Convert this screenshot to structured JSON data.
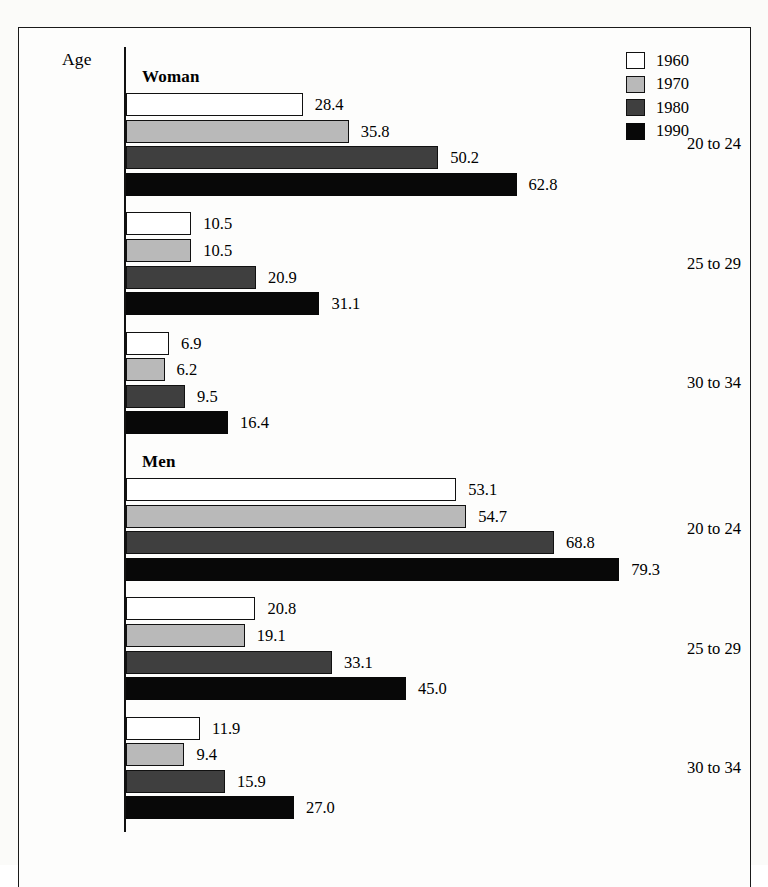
{
  "chart_data": {
    "type": "bar",
    "orientation": "horizontal",
    "title": "",
    "xlabel": "",
    "ylabel": "Age",
    "xlim": [
      0,
      100
    ],
    "grid": false,
    "legend_position": "top-right",
    "legend_entries": [
      "1960",
      "1970",
      "1980",
      "1990"
    ],
    "series_colors": {
      "1960": "#ffffff",
      "1970": "#b9b9b9",
      "1980": "#3f3f3f",
      "1990": "#080808"
    },
    "categories": [
      "20 to 24",
      "25 to 29",
      "30 to 34"
    ],
    "panels": [
      {
        "name": "Woman",
        "series": [
          {
            "name": "1960",
            "values": [
              28.4,
              10.5,
              6.9
            ]
          },
          {
            "name": "1970",
            "values": [
              35.8,
              10.5,
              6.2
            ]
          },
          {
            "name": "1980",
            "values": [
              50.2,
              20.9,
              9.5
            ]
          },
          {
            "name": "1990",
            "values": [
              62.8,
              31.1,
              16.4
            ]
          }
        ]
      },
      {
        "name": "Men",
        "series": [
          {
            "name": "1960",
            "values": [
              53.1,
              20.8,
              11.9
            ]
          },
          {
            "name": "1970",
            "values": [
              54.7,
              19.1,
              9.4
            ]
          },
          {
            "name": "1980",
            "values": [
              68.8,
              33.1,
              15.9
            ]
          },
          {
            "name": "1990",
            "values": [
              79.3,
              45.0,
              27.0
            ]
          }
        ]
      }
    ]
  },
  "axis": {
    "age_header": "Age"
  },
  "legend": {
    "items": [
      {
        "label": "1960",
        "key": "y1960"
      },
      {
        "label": "1970",
        "key": "y1970"
      },
      {
        "label": "1980",
        "key": "y1980"
      },
      {
        "label": "1990",
        "key": "y1990"
      }
    ]
  }
}
